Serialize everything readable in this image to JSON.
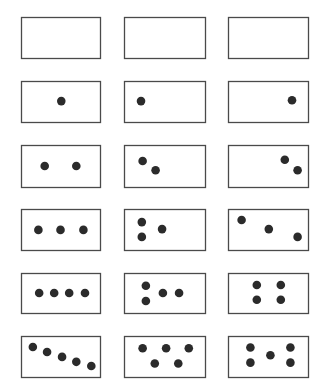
{
  "figure": {
    "title": "",
    "colors": {
      "border": "#4a4a4a",
      "dot": "#2b2b2b",
      "background": "#ffffff"
    },
    "rows": [
      {
        "count": 0,
        "cards": [
          {
            "arrangement": "empty",
            "dots": []
          },
          {
            "arrangement": "empty",
            "dots": []
          },
          {
            "arrangement": "empty",
            "dots": []
          }
        ]
      },
      {
        "count": 1,
        "cards": [
          {
            "arrangement": "center",
            "dots": [
              [
                0.51,
                0.49
              ]
            ]
          },
          {
            "arrangement": "left",
            "dots": [
              [
                0.21,
                0.49
              ]
            ]
          },
          {
            "arrangement": "right",
            "dots": [
              [
                0.8,
                0.47
              ]
            ]
          }
        ]
      },
      {
        "count": 2,
        "cards": [
          {
            "arrangement": "horizontal-pair",
            "dots": [
              [
                0.3,
                0.5
              ],
              [
                0.7,
                0.5
              ]
            ]
          },
          {
            "arrangement": "diagonal-left",
            "dots": [
              [
                0.23,
                0.38
              ],
              [
                0.39,
                0.6
              ]
            ]
          },
          {
            "arrangement": "diagonal-right",
            "dots": [
              [
                0.71,
                0.35
              ],
              [
                0.87,
                0.6
              ]
            ]
          }
        ]
      },
      {
        "count": 3,
        "cards": [
          {
            "arrangement": "horizontal-row",
            "dots": [
              [
                0.22,
                0.51
              ],
              [
                0.5,
                0.51
              ],
              [
                0.79,
                0.51
              ]
            ]
          },
          {
            "arrangement": "triangle-left",
            "dots": [
              [
                0.22,
                0.32
              ],
              [
                0.22,
                0.68
              ],
              [
                0.47,
                0.49
              ]
            ]
          },
          {
            "arrangement": "descending-diagonal",
            "dots": [
              [
                0.17,
                0.27
              ],
              [
                0.51,
                0.49
              ],
              [
                0.87,
                0.68
              ]
            ]
          }
        ]
      },
      {
        "count": 4,
        "cards": [
          {
            "arrangement": "horizontal-row",
            "dots": [
              [
                0.23,
                0.5
              ],
              [
                0.42,
                0.5
              ],
              [
                0.61,
                0.5
              ],
              [
                0.81,
                0.5
              ]
            ]
          },
          {
            "arrangement": "pair-plus-row",
            "dots": [
              [
                0.27,
                0.32
              ],
              [
                0.27,
                0.7
              ],
              [
                0.48,
                0.5
              ],
              [
                0.68,
                0.5
              ]
            ]
          },
          {
            "arrangement": "square",
            "dots": [
              [
                0.36,
                0.3
              ],
              [
                0.66,
                0.3
              ],
              [
                0.36,
                0.67
              ],
              [
                0.66,
                0.67
              ]
            ]
          }
        ]
      },
      {
        "count": 5,
        "cards": [
          {
            "arrangement": "descending-diagonal",
            "dots": [
              [
                0.15,
                0.27
              ],
              [
                0.33,
                0.39
              ],
              [
                0.52,
                0.51
              ],
              [
                0.7,
                0.63
              ],
              [
                0.89,
                0.73
              ]
            ]
          },
          {
            "arrangement": "zigzag",
            "dots": [
              [
                0.23,
                0.3
              ],
              [
                0.52,
                0.3
              ],
              [
                0.8,
                0.3
              ],
              [
                0.38,
                0.67
              ],
              [
                0.67,
                0.67
              ]
            ]
          },
          {
            "arrangement": "dice-five",
            "dots": [
              [
                0.28,
                0.28
              ],
              [
                0.28,
                0.65
              ],
              [
                0.53,
                0.47
              ],
              [
                0.78,
                0.28
              ],
              [
                0.78,
                0.65
              ]
            ]
          }
        ]
      }
    ]
  }
}
